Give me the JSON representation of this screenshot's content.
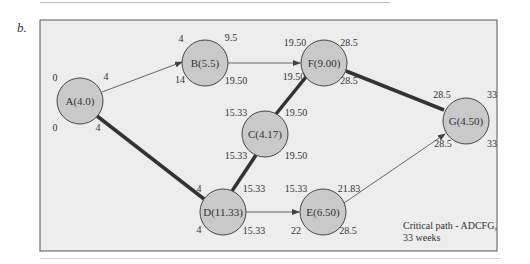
{
  "figure": {
    "label": "b.",
    "note_line1": "Critical path - ADCFG,",
    "note_line2": "33 weeks"
  },
  "colors": {
    "panel_bg": "#ededed",
    "panel_border": "#555555",
    "node_fill": "#c9c9c9",
    "node_stroke": "#444444",
    "critical_edge": "#333333",
    "normal_edge": "#666666"
  },
  "nodes": [
    {
      "id": "A",
      "label": "A(4.0)",
      "duration": 4.0,
      "es": "0",
      "ef": "4",
      "ls": "0",
      "lf": "4"
    },
    {
      "id": "B",
      "label": "B(5.5)",
      "duration": 5.5,
      "es": "4",
      "ef": "9.5",
      "ls": "14",
      "lf": "19.50"
    },
    {
      "id": "C",
      "label": "C(4.17)",
      "duration": 4.17,
      "es": "15.33",
      "ef": "19.50",
      "ls": "15.33",
      "lf": "19.50"
    },
    {
      "id": "D",
      "label": "D(11.33)",
      "duration": 11.33,
      "es": "4",
      "ef": "15.33",
      "ls": "4",
      "lf": "15.33"
    },
    {
      "id": "E",
      "label": "E(6.50)",
      "duration": 6.5,
      "es": "15.33",
      "ef": "21.83",
      "ls": "22",
      "lf": "28.5"
    },
    {
      "id": "F",
      "label": "F(9.00)",
      "duration": 9.0,
      "es": "19.50",
      "ef": "28.5",
      "ls": "19.50",
      "lf": "28.5"
    },
    {
      "id": "G",
      "label": "G(4.50)",
      "duration": 4.5,
      "es": "28.5",
      "ef": "33",
      "ls": "28.5",
      "lf": "33"
    }
  ],
  "edges": [
    {
      "from": "A",
      "to": "B",
      "critical": false
    },
    {
      "from": "A",
      "to": "D",
      "critical": true
    },
    {
      "from": "B",
      "to": "F",
      "critical": false
    },
    {
      "from": "D",
      "to": "C",
      "critical": true
    },
    {
      "from": "C",
      "to": "F",
      "critical": true
    },
    {
      "from": "D",
      "to": "E",
      "critical": false
    },
    {
      "from": "F",
      "to": "G",
      "critical": true
    },
    {
      "from": "E",
      "to": "G",
      "critical": false
    }
  ]
}
